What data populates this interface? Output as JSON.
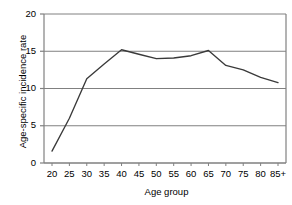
{
  "chart_data": {
    "type": "line",
    "title": "",
    "xlabel": "Age group",
    "ylabel": "Age-specific incidence rate",
    "categories": [
      "20",
      "25",
      "30",
      "35",
      "40",
      "45",
      "50",
      "55",
      "60",
      "65",
      "70",
      "75",
      "80",
      "85+"
    ],
    "values": [
      1.6,
      6.0,
      11.3,
      13.3,
      15.2,
      14.6,
      14.0,
      14.1,
      14.4,
      15.1,
      13.1,
      12.5,
      11.5,
      10.8
    ],
    "series": [
      {
        "name": "Age-specific incidence rate",
        "values": [
          1.6,
          6.0,
          11.3,
          13.3,
          15.2,
          14.6,
          14.0,
          14.1,
          14.4,
          15.1,
          13.1,
          12.5,
          11.5,
          10.8
        ]
      }
    ],
    "ylim": [
      0,
      20
    ],
    "yticks": [
      0,
      5,
      10,
      15,
      20
    ],
    "ytick_labels": [
      "0",
      "5",
      "10",
      "15",
      "20"
    ],
    "xtick_labels": [
      "20",
      "25",
      "30",
      "35",
      "40",
      "45",
      "50",
      "55",
      "60",
      "65",
      "70",
      "75",
      "80",
      "85+"
    ],
    "grid": "horizontal",
    "legend": "none",
    "line_color": "#3a3a3a",
    "grid_color": "#808080",
    "axis_color": "#808080",
    "background_color": "#ffffff"
  }
}
